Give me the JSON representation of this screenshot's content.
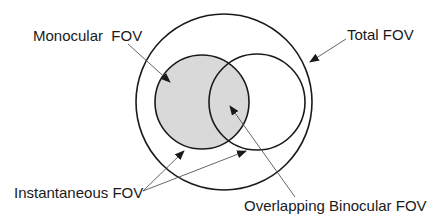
{
  "diagram": {
    "labels": {
      "monocular": "Monocular  FOV",
      "total": "Total FOV",
      "instantaneous": "Instantaneous FOV",
      "overlap": "Overlapping Binocular FOV"
    },
    "colors": {
      "stroke": "#1a1a1a",
      "shade": "#d9d9d9",
      "leader": "#555555",
      "background": "#ffffff"
    },
    "shapes": {
      "total_fov_circle": {
        "cx": 224,
        "cy": 102,
        "r": 88
      },
      "left_eye_circle": {
        "cx": 202,
        "cy": 102,
        "r": 47,
        "shaded": true
      },
      "right_eye_circle": {
        "cx": 257,
        "cy": 102,
        "r": 48,
        "shaded": false
      }
    }
  }
}
